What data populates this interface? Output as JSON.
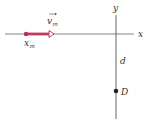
{
  "diagram": {
    "axes": {
      "x_label": "x",
      "y_label": "y",
      "color": "#555555"
    },
    "particle": {
      "position_label": "x",
      "position_subscript": "m",
      "velocity_label": "v",
      "velocity_subscript": "m",
      "color": "#b5304f"
    },
    "distance_label": "d",
    "point": {
      "label": "D",
      "color": "#222222"
    }
  }
}
